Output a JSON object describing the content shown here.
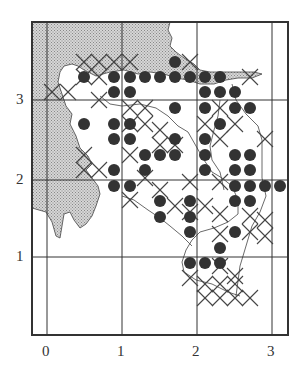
{
  "map": {
    "type": "grid distribution map",
    "frame": {
      "left": 32,
      "top": 22,
      "right": 288,
      "bottom": 335
    },
    "x_axis": {
      "ticks": [
        {
          "label": "0",
          "px": 47
        },
        {
          "label": "1",
          "px": 122
        },
        {
          "label": "2",
          "px": 197
        },
        {
          "label": "3",
          "px": 272
        }
      ]
    },
    "y_axis": {
      "ticks": [
        {
          "label": "3",
          "px": 100
        },
        {
          "label": "2",
          "px": 180
        },
        {
          "label": "1",
          "px": 257
        }
      ]
    },
    "colors": {
      "land_shade": "#b8b8b8",
      "dot": "#333333",
      "cross": "#444444",
      "grid": "#333333",
      "background": "#ffffff"
    },
    "legend": {
      "dot": "filled circle record",
      "cross": "cross record",
      "shade": "stippled area (sea/land)"
    },
    "dots": [
      [
        84,
        77
      ],
      [
        114,
        77
      ],
      [
        130,
        77
      ],
      [
        145,
        77
      ],
      [
        160,
        77
      ],
      [
        175,
        62
      ],
      [
        175,
        77
      ],
      [
        190,
        77
      ],
      [
        205,
        77
      ],
      [
        220,
        77
      ],
      [
        114,
        92
      ],
      [
        130,
        92
      ],
      [
        205,
        92
      ],
      [
        220,
        92
      ],
      [
        235,
        92
      ],
      [
        175,
        108
      ],
      [
        205,
        108
      ],
      [
        235,
        108
      ],
      [
        250,
        108
      ],
      [
        84,
        124
      ],
      [
        114,
        124
      ],
      [
        130,
        124
      ],
      [
        220,
        124
      ],
      [
        114,
        139
      ],
      [
        130,
        139
      ],
      [
        175,
        139
      ],
      [
        205,
        139
      ],
      [
        145,
        155
      ],
      [
        160,
        155
      ],
      [
        175,
        155
      ],
      [
        205,
        155
      ],
      [
        235,
        155
      ],
      [
        250,
        155
      ],
      [
        114,
        170
      ],
      [
        145,
        170
      ],
      [
        205,
        170
      ],
      [
        235,
        170
      ],
      [
        250,
        170
      ],
      [
        114,
        186
      ],
      [
        130,
        186
      ],
      [
        235,
        186
      ],
      [
        250,
        186
      ],
      [
        265,
        186
      ],
      [
        280,
        186
      ],
      [
        160,
        201
      ],
      [
        190,
        201
      ],
      [
        235,
        201
      ],
      [
        250,
        201
      ],
      [
        160,
        217
      ],
      [
        190,
        217
      ],
      [
        190,
        232
      ],
      [
        235,
        232
      ],
      [
        220,
        248
      ],
      [
        190,
        263
      ],
      [
        205,
        263
      ],
      [
        220,
        263
      ]
    ],
    "crosses": [
      [
        84,
        62
      ],
      [
        99,
        62
      ],
      [
        114,
        62
      ],
      [
        130,
        62
      ],
      [
        84,
        77
      ],
      [
        99,
        77
      ],
      [
        68,
        92
      ],
      [
        52,
        92
      ],
      [
        145,
        108
      ],
      [
        190,
        62
      ],
      [
        250,
        77
      ],
      [
        99,
        100
      ],
      [
        130,
        108
      ],
      [
        130,
        124
      ],
      [
        145,
        124
      ],
      [
        160,
        130
      ],
      [
        160,
        145
      ],
      [
        220,
        108
      ],
      [
        205,
        124
      ],
      [
        220,
        139
      ],
      [
        235,
        124
      ],
      [
        265,
        139
      ],
      [
        175,
        145
      ],
      [
        84,
        155
      ],
      [
        99,
        170
      ],
      [
        84,
        170
      ],
      [
        130,
        155
      ],
      [
        145,
        178
      ],
      [
        160,
        190
      ],
      [
        190,
        182
      ],
      [
        220,
        182
      ],
      [
        175,
        206
      ],
      [
        190,
        212
      ],
      [
        205,
        206
      ],
      [
        220,
        214
      ],
      [
        130,
        200
      ],
      [
        250,
        216
      ],
      [
        265,
        220
      ],
      [
        250,
        232
      ],
      [
        265,
        236
      ],
      [
        220,
        234
      ],
      [
        190,
        278
      ],
      [
        205,
        284
      ],
      [
        220,
        284
      ],
      [
        235,
        284
      ],
      [
        205,
        298
      ],
      [
        220,
        298
      ],
      [
        235,
        298
      ],
      [
        250,
        298
      ],
      [
        220,
        266
      ],
      [
        235,
        276
      ]
    ]
  }
}
